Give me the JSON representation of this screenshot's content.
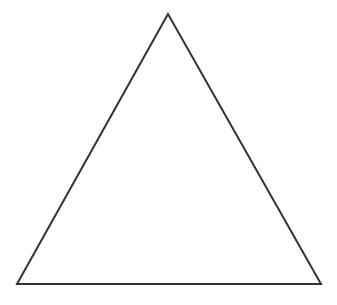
{
  "diagram": {
    "shape": "triangle",
    "kind": "equilateral-outline",
    "vertices": [
      {
        "name": "apex",
        "x": 168,
        "y": 14
      },
      {
        "name": "bottom-left",
        "x": 17,
        "y": 284
      },
      {
        "name": "bottom-right",
        "x": 321,
        "y": 284
      }
    ],
    "stroke_color": "#333333",
    "stroke_width": 2,
    "fill_color": "#ffffff",
    "background": "#ffffff"
  }
}
